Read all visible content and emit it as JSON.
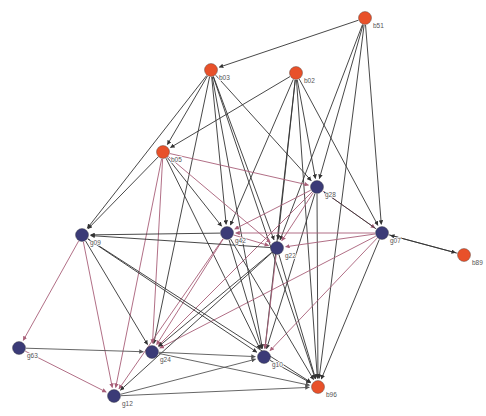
{
  "figure": {
    "type": "directed-network-graph",
    "width": 486,
    "height": 416,
    "background": "#ffffff"
  },
  "style": {
    "node_orange": "#e8512a",
    "node_blue": "#3b3b77",
    "edge_dark": "#333333",
    "edge_pink": "#a85f78",
    "label_color": "#555555",
    "node_radius_orange": 6.5,
    "node_radius_blue": 6.5,
    "label_font_size": 6.5
  },
  "chart_data": {
    "type": "graph",
    "title": "",
    "directed": true,
    "node_count": 16,
    "edge_count": 63,
    "groups": [
      {
        "name": "b",
        "color": "#e8512a",
        "label": "b-nodes"
      },
      {
        "name": "g",
        "color": "#3b3b77",
        "label": "g-nodes"
      }
    ],
    "nodes": [
      {
        "id": "b51",
        "label": "b51",
        "x": 365,
        "y": 18,
        "group": "b"
      },
      {
        "id": "b03",
        "label": "b03",
        "x": 211,
        "y": 70,
        "group": "b"
      },
      {
        "id": "b02",
        "label": "b02",
        "x": 296,
        "y": 73,
        "group": "b"
      },
      {
        "id": "b05",
        "label": "b05",
        "x": 163,
        "y": 152,
        "group": "b"
      },
      {
        "id": "g28",
        "label": "g28",
        "x": 317,
        "y": 187,
        "group": "g"
      },
      {
        "id": "g07",
        "label": "g07",
        "x": 382,
        "y": 233,
        "group": "g"
      },
      {
        "id": "g42",
        "label": "g42",
        "x": 227,
        "y": 233,
        "group": "g"
      },
      {
        "id": "g22",
        "label": "g22",
        "x": 277,
        "y": 248,
        "group": "g"
      },
      {
        "id": "g09",
        "label": "g09",
        "x": 82,
        "y": 235,
        "group": "g"
      },
      {
        "id": "b89",
        "label": "b89",
        "x": 464,
        "y": 255,
        "group": "b"
      },
      {
        "id": "g63",
        "label": "g63",
        "x": 19,
        "y": 348,
        "group": "g"
      },
      {
        "id": "g24",
        "label": "g24",
        "x": 152,
        "y": 352,
        "group": "g"
      },
      {
        "id": "g10",
        "label": "g10",
        "x": 264,
        "y": 357,
        "group": "g"
      },
      {
        "id": "b96",
        "label": "b96",
        "x": 318,
        "y": 387,
        "group": "b"
      },
      {
        "id": "g12",
        "label": "g12",
        "x": 114,
        "y": 396,
        "group": "g"
      }
    ],
    "edges": [
      {
        "source": "b51",
        "target": "b03",
        "color": "#333333"
      },
      {
        "source": "b51",
        "target": "g28",
        "color": "#333333"
      },
      {
        "source": "b51",
        "target": "g22",
        "color": "#333333"
      },
      {
        "source": "b51",
        "target": "g07",
        "color": "#333333"
      },
      {
        "source": "b51",
        "target": "b96",
        "color": "#333333"
      },
      {
        "source": "b03",
        "target": "b05",
        "color": "#333333"
      },
      {
        "source": "b03",
        "target": "g42",
        "color": "#333333"
      },
      {
        "source": "b03",
        "target": "g22",
        "color": "#333333"
      },
      {
        "source": "b03",
        "target": "g28",
        "color": "#333333"
      },
      {
        "source": "b03",
        "target": "g10",
        "color": "#333333"
      },
      {
        "source": "b03",
        "target": "g24",
        "color": "#333333"
      },
      {
        "source": "b03",
        "target": "g09",
        "color": "#333333"
      },
      {
        "source": "b03",
        "target": "b96",
        "color": "#333333"
      },
      {
        "source": "b02",
        "target": "b05",
        "color": "#333333"
      },
      {
        "source": "b02",
        "target": "g42",
        "color": "#333333"
      },
      {
        "source": "b02",
        "target": "g22",
        "color": "#333333"
      },
      {
        "source": "b02",
        "target": "g28",
        "color": "#333333"
      },
      {
        "source": "b02",
        "target": "g10",
        "color": "#333333"
      },
      {
        "source": "b02",
        "target": "b96",
        "color": "#333333"
      },
      {
        "source": "b02",
        "target": "g07",
        "color": "#333333"
      },
      {
        "source": "b05",
        "target": "g28",
        "color": "#a85f78"
      },
      {
        "source": "b05",
        "target": "g22",
        "color": "#a85f78"
      },
      {
        "source": "b05",
        "target": "g42",
        "color": "#333333"
      },
      {
        "source": "b05",
        "target": "g24",
        "color": "#a85f78"
      },
      {
        "source": "b05",
        "target": "g12",
        "color": "#a85f78"
      },
      {
        "source": "b05",
        "target": "g10",
        "color": "#333333"
      },
      {
        "source": "b05",
        "target": "g09",
        "color": "#333333"
      },
      {
        "source": "g28",
        "target": "g22",
        "color": "#a85f78"
      },
      {
        "source": "g28",
        "target": "g07",
        "color": "#a85f78"
      },
      {
        "source": "g28",
        "target": "g42",
        "color": "#a85f78"
      },
      {
        "source": "g28",
        "target": "g10",
        "color": "#333333"
      },
      {
        "source": "g28",
        "target": "b96",
        "color": "#333333"
      },
      {
        "source": "g28",
        "target": "g24",
        "color": "#a85f78"
      },
      {
        "source": "g07",
        "target": "g22",
        "color": "#a85f78"
      },
      {
        "source": "g07",
        "target": "g42",
        "color": "#a85f78"
      },
      {
        "source": "g07",
        "target": "g24",
        "color": "#a85f78"
      },
      {
        "source": "g07",
        "target": "g10",
        "color": "#a85f78"
      },
      {
        "source": "g07",
        "target": "b96",
        "color": "#333333"
      },
      {
        "source": "g07",
        "target": "b89",
        "color": "#333333"
      },
      {
        "source": "g07",
        "target": "g28",
        "color": "#333333"
      },
      {
        "source": "g42",
        "target": "g22",
        "color": "#a85f78"
      },
      {
        "source": "g42",
        "target": "g24",
        "color": "#a85f78"
      },
      {
        "source": "g42",
        "target": "g12",
        "color": "#a85f78"
      },
      {
        "source": "g42",
        "target": "g10",
        "color": "#333333"
      },
      {
        "source": "g42",
        "target": "g09",
        "color": "#333333"
      },
      {
        "source": "g42",
        "target": "b96",
        "color": "#333333"
      },
      {
        "source": "g22",
        "target": "g10",
        "color": "#a85f78"
      },
      {
        "source": "g22",
        "target": "g24",
        "color": "#333333"
      },
      {
        "source": "g22",
        "target": "g12",
        "color": "#333333"
      },
      {
        "source": "g22",
        "target": "b96",
        "color": "#333333"
      },
      {
        "source": "g22",
        "target": "g09",
        "color": "#333333"
      },
      {
        "source": "g09",
        "target": "g63",
        "color": "#a85f78"
      },
      {
        "source": "g09",
        "target": "g12",
        "color": "#a85f78"
      },
      {
        "source": "g09",
        "target": "g24",
        "color": "#333333"
      },
      {
        "source": "g09",
        "target": "g10",
        "color": "#333333"
      },
      {
        "source": "g09",
        "target": "b96",
        "color": "#333333"
      },
      {
        "source": "g63",
        "target": "g24",
        "color": "#555555"
      },
      {
        "source": "g63",
        "target": "g12",
        "color": "#a85f78"
      },
      {
        "source": "g12",
        "target": "g10",
        "color": "#555555"
      },
      {
        "source": "g12",
        "target": "b96",
        "color": "#555555"
      },
      {
        "source": "g24",
        "target": "g10",
        "color": "#555555"
      },
      {
        "source": "g24",
        "target": "b96",
        "color": "#555555"
      },
      {
        "source": "g10",
        "target": "b96",
        "color": "#333333"
      },
      {
        "source": "b89",
        "target": "g07",
        "color": "#333333"
      }
    ]
  }
}
